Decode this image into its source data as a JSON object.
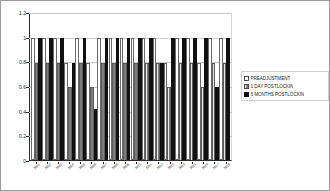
{
  "chart_data": {
    "type": "bar",
    "title": "",
    "subtitle": "",
    "xlabel": "",
    "ylabel": "",
    "ylim": [
      0,
      1.2
    ],
    "yticks": [
      0,
      0.2,
      0.4,
      0.6,
      0.8,
      1,
      1.2
    ],
    "ytick_labels": [
      "0",
      "0.2",
      "0.4",
      "0.6",
      "0.8",
      "1",
      "1.2"
    ],
    "grid": true,
    "legend_position": "right",
    "categories": [
      "2001",
      "2002",
      "2003",
      "2004",
      "2005",
      "2006",
      "2007",
      "2008",
      "2009",
      "2010",
      "2011",
      "2012",
      "2013",
      "2014",
      "2015",
      "2016",
      "2017",
      "2018"
    ],
    "series": [
      {
        "name": "PREADJUSTMENT",
        "color": "#ffffff",
        "values": [
          1,
          1,
          1,
          0.8,
          1,
          0.8,
          1,
          1,
          1,
          1,
          1,
          1,
          0.8,
          1,
          1,
          0.8,
          1,
          1
        ]
      },
      {
        "name": "1 DAY POSTLOCKIN",
        "color": "#7d7d7d",
        "values": [
          0.8,
          0.8,
          0.8,
          0.6,
          0.8,
          0.6,
          0.8,
          0.8,
          0.8,
          0.8,
          0.8,
          0.8,
          0.6,
          0.8,
          0.8,
          0.6,
          0.8,
          0.8
        ]
      },
      {
        "name": "6 MONTHS POSTLOCKIN",
        "color": "#111111",
        "values": [
          1,
          1,
          1,
          0.8,
          1,
          0.42,
          1,
          1,
          1,
          1,
          1,
          0.8,
          1,
          1,
          1,
          1,
          0.6,
          1
        ]
      }
    ]
  },
  "legend": {
    "items": [
      {
        "label": "PREADJUSTMENT",
        "swatch": "pre"
      },
      {
        "label": "1 DAY POSTLOCKIN",
        "swatch": "day1"
      },
      {
        "label": "6 MONTHS POSTLOCKIN",
        "swatch": "mo6"
      }
    ]
  }
}
